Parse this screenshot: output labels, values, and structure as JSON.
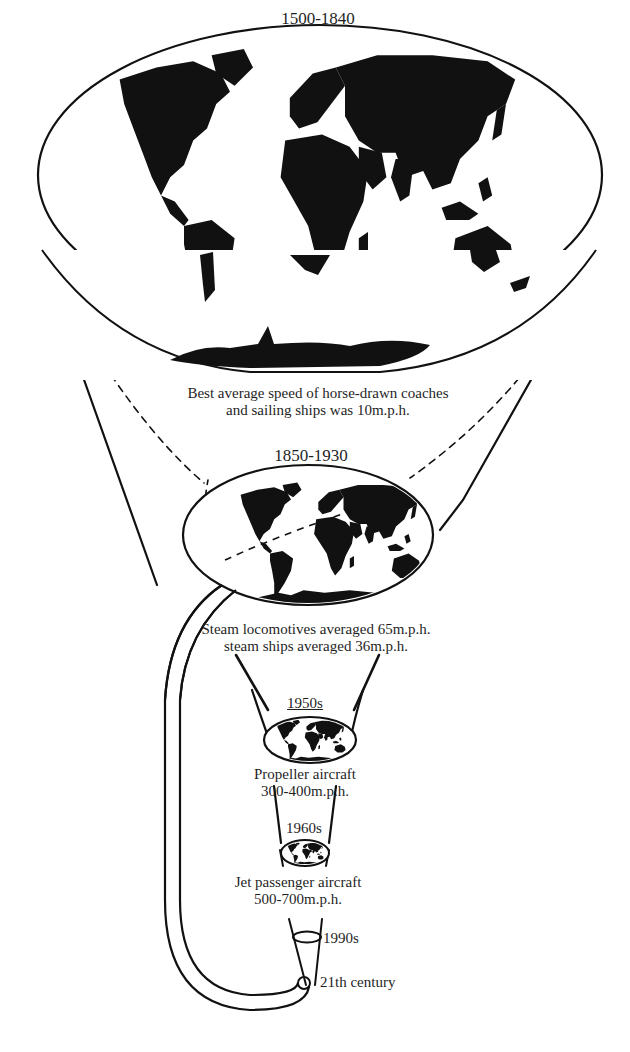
{
  "figure": {
    "ink_color": "#111111",
    "background_color": "#ffffff"
  },
  "eras": [
    {
      "period": "1500-1840",
      "caption_line1": "Best average speed of horse-drawn coaches",
      "caption_line2": "and sailing ships was 10m.p.h."
    },
    {
      "period": "1850-1930",
      "caption_line1": "Steam locomotives averaged 65m.p.h.",
      "caption_line2": "steam ships averaged 36m.p.h."
    },
    {
      "period": "1950s",
      "caption_line1": "Propeller aircraft",
      "caption_line2": "300-400m.p.h."
    },
    {
      "period": "1960s",
      "caption_line1": "Jet passenger aircraft",
      "caption_line2": "500-700m.p.h."
    },
    {
      "period": "1990s"
    },
    {
      "period": "21th century"
    }
  ]
}
